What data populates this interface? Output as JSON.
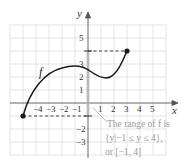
{
  "figure": {
    "function_label": "f",
    "x_axis_label": "x",
    "y_axis_label": "y",
    "x_ticks": [
      "−4",
      "−3",
      "−2",
      "−1",
      "1",
      "2",
      "3",
      "4",
      "5"
    ],
    "y_ticks": [
      "5",
      "3",
      "2",
      "1",
      "−2",
      "−3"
    ],
    "annotation": {
      "line1": "The range of f is",
      "line2": "{y|−1 ≤ y ≤ 4},",
      "line3": "or [−1, 4]"
    },
    "endpoints": [
      {
        "x": -5,
        "y": -1
      },
      {
        "x": 3,
        "y": 4
      }
    ],
    "colors": {
      "grid": "#dddddd",
      "curve": "#1a1a1a",
      "axis": "#555555",
      "range_bar": "#999999",
      "annotation": "#9a9a9a"
    }
  }
}
